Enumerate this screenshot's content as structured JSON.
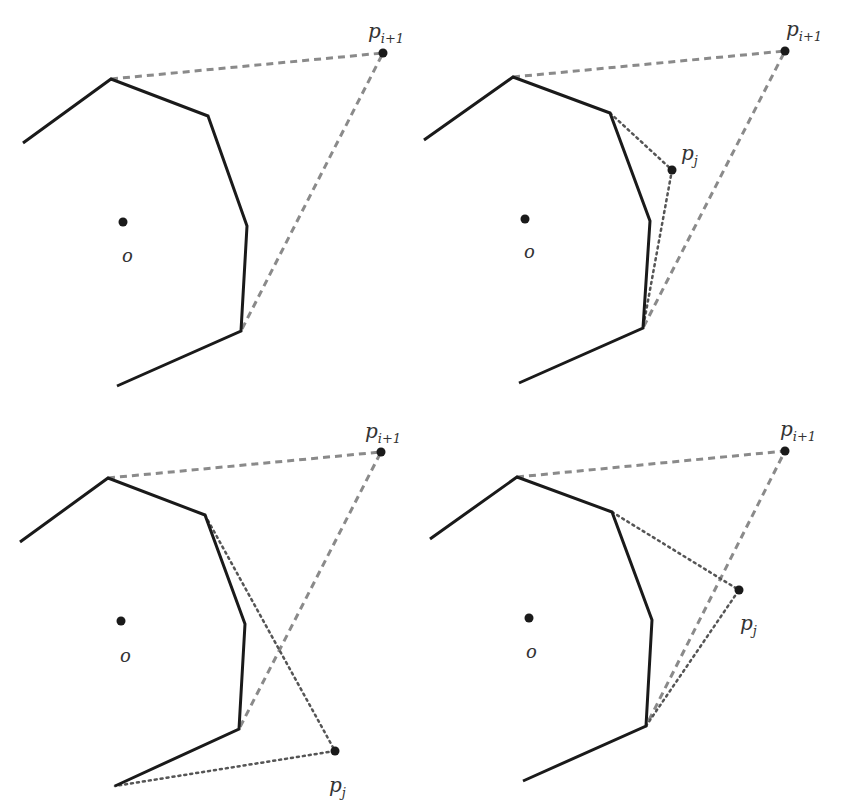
{
  "colors": {
    "hull": "#1a1a1a",
    "dashed": "#8a8a8a",
    "dotted": "#555555",
    "point": "#1a1a1a"
  },
  "panels": [
    {
      "name": "panel-top-left",
      "hull": [
        [
          23,
          143
        ],
        [
          111,
          79
        ],
        [
          208,
          116
        ],
        [
          247,
          226
        ],
        [
          241,
          331
        ],
        [
          117,
          386
        ]
      ],
      "center": [
        123,
        222
      ],
      "center_label": "o",
      "center_label_pos": [
        122,
        262
      ],
      "p_next": [
        383,
        53
      ],
      "p_next_label": "p",
      "p_next_sub": "i+1",
      "p_next_label_pos": [
        368,
        38
      ],
      "dashed": [
        [
          111,
          79
        ],
        [
          383,
          53
        ],
        [
          241,
          331
        ]
      ],
      "p_j": null,
      "dotted": []
    },
    {
      "name": "panel-top-right",
      "hull": [
        [
          424,
          140
        ],
        [
          513,
          77
        ],
        [
          610,
          113
        ],
        [
          650,
          221
        ],
        [
          643,
          328
        ],
        [
          519,
          383
        ]
      ],
      "center": [
        525,
        219
      ],
      "center_label": "o",
      "center_label_pos": [
        524,
        258
      ],
      "p_next": [
        785,
        51
      ],
      "p_next_label": "p",
      "p_next_sub": "i+1",
      "p_next_label_pos": [
        786,
        36
      ],
      "dashed": [
        [
          513,
          77
        ],
        [
          785,
          51
        ],
        [
          643,
          328
        ]
      ],
      "p_j": [
        672,
        170
      ],
      "p_j_label": "p",
      "p_j_sub": "j",
      "p_j_label_pos": [
        681,
        160
      ],
      "dotted": [
        [
          610,
          113
        ],
        [
          672,
          170
        ],
        [
          643,
          328
        ]
      ]
    },
    {
      "name": "panel-bottom-left",
      "hull": [
        [
          20,
          542
        ],
        [
          108,
          478
        ],
        [
          205,
          515
        ],
        [
          245,
          624
        ],
        [
          239,
          729
        ],
        [
          115,
          786
        ]
      ],
      "center": [
        121,
        621
      ],
      "center_label": "o",
      "center_label_pos": [
        120,
        662
      ],
      "p_next": [
        381,
        452
      ],
      "p_next_label": "p",
      "p_next_sub": "i+1",
      "p_next_label_pos": [
        365,
        438
      ],
      "dashed": [
        [
          108,
          478
        ],
        [
          381,
          452
        ],
        [
          239,
          729
        ]
      ],
      "p_j": [
        335,
        751
      ],
      "p_j_label": "p",
      "p_j_sub": "j",
      "p_j_label_pos": [
        329,
        792
      ],
      "dotted": [
        [
          205,
          515
        ],
        [
          335,
          751
        ],
        [
          115,
          786
        ]
      ]
    },
    {
      "name": "panel-bottom-right",
      "hull": [
        [
          430,
          539
        ],
        [
          517,
          477
        ],
        [
          612,
          512
        ],
        [
          652,
          620
        ],
        [
          646,
          726
        ],
        [
          523,
          781
        ]
      ],
      "center": [
        529,
        618
      ],
      "center_label": "o",
      "center_label_pos": [
        526,
        658
      ],
      "p_next": [
        785,
        451
      ],
      "p_next_label": "p",
      "p_next_sub": "i+1",
      "p_next_label_pos": [
        780,
        436
      ],
      "dashed": [
        [
          517,
          477
        ],
        [
          785,
          451
        ],
        [
          646,
          726
        ]
      ],
      "p_j": [
        739,
        590
      ],
      "p_j_label": "p",
      "p_j_sub": "j",
      "p_j_label_pos": [
        740,
        630
      ],
      "dotted": [
        [
          612,
          512
        ],
        [
          739,
          590
        ],
        [
          646,
          726
        ]
      ]
    }
  ]
}
